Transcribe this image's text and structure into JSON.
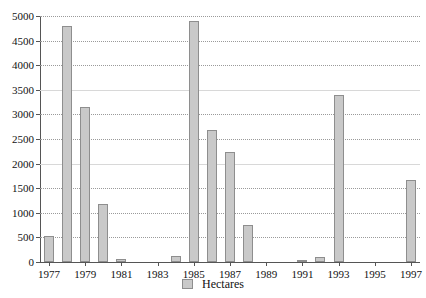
{
  "chart_data": {
    "type": "bar",
    "title": "",
    "subtitle": "",
    "xlabel": "",
    "ylabel": "",
    "ylim": [
      0,
      5000
    ],
    "ytick_step": 500,
    "yticks": [
      0,
      500,
      1000,
      1500,
      2000,
      2500,
      3000,
      3500,
      4000,
      4500,
      5000
    ],
    "ytick_labels": [
      "0",
      "500",
      "1000",
      "1500",
      "2000",
      "2500",
      "3000",
      "3500",
      "4000",
      "4500",
      "5000"
    ],
    "xlim": [
      1976.5,
      1997.5
    ],
    "xtick_labels": [
      "1977",
      "1979",
      "1981",
      "1983",
      "1985",
      "1987",
      "1989",
      "1991",
      "1993",
      "1995",
      "1997"
    ],
    "xticks": [
      1977,
      1979,
      1981,
      1983,
      1985,
      1987,
      1989,
      1991,
      1993,
      1995,
      1997
    ],
    "grid": true,
    "grid_axis": "y",
    "legend_position": "bottom",
    "categories": [
      "1977",
      "1978",
      "1979",
      "1980",
      "1981",
      "1982",
      "1983",
      "1984",
      "1985",
      "1986",
      "1987",
      "1988",
      "1989",
      "1990",
      "1991",
      "1992",
      "1993",
      "1994",
      "1995",
      "1996",
      "1997"
    ],
    "series": [
      {
        "name": "Hectares",
        "color": "#c9c9c9",
        "edge_color": "#8e8e8e",
        "values": [
          520,
          4790,
          3150,
          1180,
          60,
          0,
          0,
          130,
          4890,
          2690,
          2240,
          750,
          0,
          0,
          50,
          110,
          3390,
          0,
          0,
          0,
          1660
        ]
      }
    ]
  },
  "legend": {
    "entries": [
      {
        "label": "Hectares",
        "swatch_name": "legend-swatch-hectares"
      }
    ]
  }
}
